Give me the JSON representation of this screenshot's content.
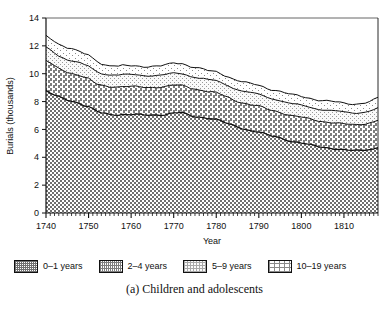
{
  "figure": {
    "caption": "(a) Children and adolescents",
    "ghost_text_top": " "
  },
  "axes": {
    "y_title": "Burials (thousands)",
    "x_title": "Year",
    "y_ticks": [
      "0",
      "2",
      "4",
      "6",
      "8",
      "10",
      "12",
      "14"
    ],
    "x_ticks": [
      "1740",
      "1750",
      "1760",
      "1770",
      "1780",
      "1790",
      "1800",
      "1810"
    ]
  },
  "legend": {
    "items": [
      {
        "label": "0–1 years",
        "pattern": "dense-checker",
        "color": "#8c8c8c"
      },
      {
        "label": "2–4 years",
        "pattern": "medium-checker",
        "color": "#a8a8a8"
      },
      {
        "label": "5–9 years",
        "pattern": "light-stipple",
        "color": "#e0e0e0"
      },
      {
        "label": "10–19 years",
        "pattern": "sparse-dots",
        "color": "#f2f2f2"
      }
    ]
  },
  "chart_data": {
    "type": "area",
    "stacked": true,
    "title": "",
    "xlabel": "Year",
    "ylabel": "Burials (thousands)",
    "xlim": [
      1740,
      1818
    ],
    "ylim": [
      0,
      14
    ],
    "ytick_step": 2,
    "xtick_step": 10,
    "x_minor_tick_step": 1,
    "grid": false,
    "legend_position": "below-plot",
    "x": [
      1740,
      1741,
      1742,
      1743,
      1744,
      1745,
      1746,
      1747,
      1748,
      1749,
      1750,
      1751,
      1752,
      1753,
      1754,
      1755,
      1756,
      1757,
      1758,
      1759,
      1760,
      1761,
      1762,
      1763,
      1764,
      1765,
      1766,
      1767,
      1768,
      1769,
      1770,
      1771,
      1772,
      1773,
      1774,
      1775,
      1776,
      1777,
      1778,
      1779,
      1780,
      1781,
      1782,
      1783,
      1784,
      1785,
      1786,
      1787,
      1788,
      1789,
      1790,
      1791,
      1792,
      1793,
      1794,
      1795,
      1796,
      1797,
      1798,
      1799,
      1800,
      1801,
      1802,
      1803,
      1804,
      1805,
      1806,
      1807,
      1808,
      1809,
      1810,
      1811,
      1812,
      1813,
      1814,
      1815,
      1816,
      1817,
      1818
    ],
    "series": [
      {
        "name": "0–1 years",
        "values": [
          8.75,
          8.6,
          8.45,
          8.35,
          8.25,
          8.15,
          8.05,
          7.95,
          7.85,
          7.7,
          7.6,
          7.45,
          7.3,
          7.2,
          7.15,
          7.1,
          7.1,
          7.05,
          7.05,
          7.05,
          7.05,
          7.05,
          7.05,
          7.05,
          7.05,
          7.05,
          7.05,
          7.05,
          7.05,
          7.1,
          7.15,
          7.2,
          7.2,
          7.1,
          7.0,
          6.95,
          6.9,
          6.85,
          6.8,
          6.75,
          6.7,
          6.6,
          6.5,
          6.4,
          6.3,
          6.2,
          6.1,
          6.0,
          5.9,
          5.85,
          5.8,
          5.7,
          5.6,
          5.55,
          5.5,
          5.4,
          5.3,
          5.2,
          5.1,
          5.05,
          5.0,
          4.95,
          4.9,
          4.85,
          4.8,
          4.75,
          4.7,
          4.65,
          4.6,
          4.55,
          4.5,
          4.5,
          4.5,
          4.5,
          4.5,
          4.55,
          4.6,
          4.6,
          4.7
        ]
      },
      {
        "name": "2–4 years",
        "values": [
          2.15,
          2.15,
          2.1,
          2.05,
          2.05,
          2.0,
          2.0,
          2.0,
          2.0,
          2.0,
          2.0,
          1.95,
          1.95,
          2.0,
          2.0,
          2.0,
          2.0,
          2.0,
          2.0,
          2.0,
          2.0,
          2.0,
          2.0,
          2.0,
          2.0,
          2.0,
          2.0,
          2.0,
          2.0,
          2.0,
          2.0,
          1.95,
          1.95,
          2.0,
          2.0,
          2.0,
          1.95,
          1.95,
          1.9,
          1.9,
          1.9,
          1.9,
          1.9,
          1.9,
          1.85,
          1.85,
          1.85,
          1.85,
          1.85,
          1.85,
          1.85,
          1.85,
          1.85,
          1.85,
          1.85,
          1.85,
          1.85,
          1.85,
          1.85,
          1.85,
          1.85,
          1.85,
          1.85,
          1.85,
          1.85,
          1.85,
          1.85,
          1.85,
          1.85,
          1.85,
          1.85,
          1.85,
          1.85,
          1.85,
          1.9,
          1.9,
          1.9,
          1.95,
          1.95
        ]
      },
      {
        "name": "5–9 years",
        "values": [
          0.95,
          0.95,
          0.95,
          0.9,
          0.9,
          0.9,
          0.9,
          0.9,
          0.9,
          0.9,
          0.9,
          0.9,
          0.9,
          0.85,
          0.85,
          0.85,
          0.85,
          0.85,
          0.85,
          0.85,
          0.85,
          0.85,
          0.85,
          0.85,
          0.85,
          0.85,
          0.85,
          0.85,
          0.85,
          0.85,
          0.85,
          0.85,
          0.85,
          0.85,
          0.85,
          0.85,
          0.85,
          0.85,
          0.85,
          0.85,
          0.85,
          0.85,
          0.85,
          0.85,
          0.85,
          0.85,
          0.85,
          0.85,
          0.85,
          0.85,
          0.85,
          0.85,
          0.85,
          0.85,
          0.85,
          0.85,
          0.85,
          0.85,
          0.85,
          0.85,
          0.85,
          0.85,
          0.85,
          0.85,
          0.85,
          0.85,
          0.85,
          0.85,
          0.85,
          0.85,
          0.85,
          0.85,
          0.85,
          0.85,
          0.85,
          0.85,
          0.85,
          0.85,
          0.85
        ]
      },
      {
        "name": "10–19 years",
        "values": [
          0.85,
          0.85,
          0.85,
          0.85,
          0.85,
          0.85,
          0.85,
          0.8,
          0.8,
          0.8,
          0.8,
          0.8,
          0.8,
          0.7,
          0.65,
          0.65,
          0.65,
          0.6,
          0.65,
          0.65,
          0.65,
          0.65,
          0.65,
          0.65,
          0.65,
          0.65,
          0.65,
          0.65,
          0.7,
          0.7,
          0.75,
          0.75,
          0.75,
          0.7,
          0.7,
          0.7,
          0.7,
          0.65,
          0.65,
          0.65,
          0.65,
          0.65,
          0.65,
          0.65,
          0.65,
          0.65,
          0.65,
          0.65,
          0.65,
          0.65,
          0.65,
          0.65,
          0.65,
          0.65,
          0.65,
          0.65,
          0.65,
          0.65,
          0.65,
          0.65,
          0.65,
          0.65,
          0.65,
          0.65,
          0.65,
          0.65,
          0.65,
          0.65,
          0.65,
          0.65,
          0.65,
          0.65,
          0.65,
          0.65,
          0.65,
          0.65,
          0.65,
          0.7,
          0.75
        ]
      }
    ],
    "totals_note": "Top of stack falls from about 12.7 in 1740 to about 8.2 in 1818"
  }
}
